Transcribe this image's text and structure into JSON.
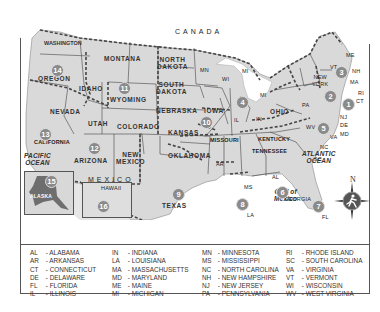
{
  "map": {
    "country_labels": {
      "canada": "CANADA",
      "mexico": "MEXICO"
    },
    "oceans": {
      "pacific": "PACIFIC\nOCEAN",
      "atlantic": "ATLANTIC\nOCEAN",
      "gulf": "Gulf of\nMexico"
    },
    "states": {
      "washington": "WASHINGTON",
      "oregon": "OREGON",
      "california": "CALIFORNIA",
      "nevada": "NEVADA",
      "idaho": "IDAHO",
      "montana": "MONTANA",
      "wyoming": "WYOMING",
      "utah": "UTAH",
      "arizona": "ARIZONA",
      "colorado": "COLORADO",
      "new_mexico": "NEW\nMEXICO",
      "north_dakota": "NORTH\nDAKOTA",
      "south_dakota": "SOUTH\nDAKOTA",
      "nebraska": "NEBRASKA",
      "kansas": "KANSAS",
      "oklahoma": "OKLAHOMA",
      "texas": "TEXAS",
      "mn": "MN",
      "iowa": "IOWA",
      "missouri": "MISSOURI",
      "ar": "AR",
      "la": "LA",
      "wi": "WI",
      "mi1": "MI",
      "mi2": "MI",
      "il": "IL",
      "in": "IN",
      "ohio": "OHIO",
      "kentucky": "KENTUCKY",
      "tennessee": "TENNESSEE",
      "ms": "MS",
      "al": "AL",
      "georgia": "GEORGIA",
      "fl": "FL",
      "sc": "SC",
      "nc": "NC",
      "va": "VA",
      "wv": "WV",
      "pa": "PA",
      "new_york": "NEW\nYORK",
      "vt": "VT",
      "nh": "NH",
      "me": "ME",
      "ma": "MA",
      "ri": "RI",
      "ct": "CT",
      "nj": "NJ",
      "de": "DE",
      "md": "MD",
      "alaska": "ALASKA",
      "hawaii": "HAWAII"
    },
    "region_numbers": {
      "r1": "1",
      "r2": "2",
      "r3": "3",
      "r4": "4",
      "r5": "5",
      "r6": "6",
      "r7": "7",
      "r8": "8",
      "r9": "9",
      "r10": "10",
      "r11": "11",
      "r12": "12",
      "r13": "13",
      "r14": "14",
      "r15": "15",
      "r16": "16"
    },
    "compass": {
      "north": "N"
    }
  },
  "legend": {
    "columns": [
      [
        {
          "abbr": "AL",
          "name": "ALABAMA"
        },
        {
          "abbr": "AR",
          "name": "ARKANSAS"
        },
        {
          "abbr": "CT",
          "name": "CONNECTICUT"
        },
        {
          "abbr": "DE",
          "name": "DELAWARE"
        },
        {
          "abbr": "FL",
          "name": "FLORIDA"
        },
        {
          "abbr": "IL",
          "name": "ILLINOIS"
        }
      ],
      [
        {
          "abbr": "IN",
          "name": "INDIANA"
        },
        {
          "abbr": "LA",
          "name": "LOUISIANA"
        },
        {
          "abbr": "MA",
          "name": "MASSACHUSETTS"
        },
        {
          "abbr": "MD",
          "name": "MARYLAND"
        },
        {
          "abbr": "ME",
          "name": "MAINE"
        },
        {
          "abbr": "MI",
          "name": "MICHIGAN"
        }
      ],
      [
        {
          "abbr": "MN",
          "name": "MINNESOTA"
        },
        {
          "abbr": "MS",
          "name": "MISSISSIPPI"
        },
        {
          "abbr": "NC",
          "name": "NORTH CAROLINA"
        },
        {
          "abbr": "NH",
          "name": "NEW HAMPSHIRE"
        },
        {
          "abbr": "NJ",
          "name": "NEW JERSEY"
        },
        {
          "abbr": "PA",
          "name": "PENNSYLVANIA"
        }
      ],
      [
        {
          "abbr": "RI",
          "name": "RHODE ISLAND"
        },
        {
          "abbr": "SC",
          "name": "SOUTH CAROLINA"
        },
        {
          "abbr": "VA",
          "name": "VIRGINIA"
        },
        {
          "abbr": "VT",
          "name": "VERMONT"
        },
        {
          "abbr": "WI",
          "name": "WISCONSIN"
        },
        {
          "abbr": "WV",
          "name": "WEST VIRGINIA"
        }
      ]
    ]
  },
  "colors": {
    "land": "#d9d9d9",
    "water": "#ffffff",
    "border_dash": "#555555",
    "region_badge": "#8a8a8a",
    "alaska": "#6e6e6e",
    "compass": "#555555"
  }
}
